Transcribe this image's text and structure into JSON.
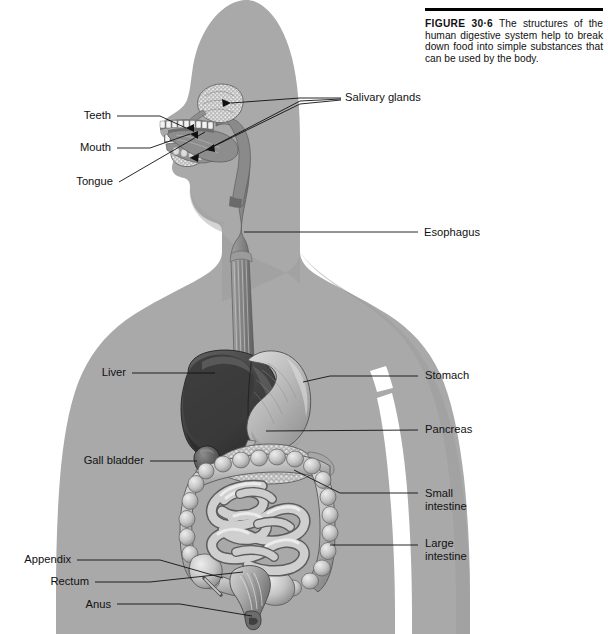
{
  "figure": {
    "number": "30·6",
    "label_word": "FIGURE",
    "caption": "The structures of the human digestive system help to break down food into simple substances that can be used by the body."
  },
  "colors": {
    "silhouette": "#a9a9a9",
    "silhouette_shadow": "#9a9a9a",
    "background": "#ffffff",
    "leader_line": "#111111",
    "text": "#111111",
    "liver": "#4a4a4a",
    "stomach": "#bdbdbd",
    "intestine": "#c9c9c9",
    "esophagus": "#8e8e8e",
    "rule": "#000000"
  },
  "labels": {
    "left": [
      {
        "id": "teeth",
        "text": "Teeth",
        "x": 80,
        "y": 109,
        "anchor_x": 115,
        "anchor_y": 116,
        "tip_x": 186,
        "tip_y": 128
      },
      {
        "id": "mouth",
        "text": "Mouth",
        "x": 78,
        "y": 141,
        "anchor_x": 115,
        "anchor_y": 148,
        "tip_x": 190,
        "tip_y": 134
      },
      {
        "id": "tongue",
        "text": "Tongue",
        "x": 75,
        "y": 175,
        "anchor_x": 117,
        "anchor_y": 182,
        "tip_x": 205,
        "tip_y": 132
      },
      {
        "id": "liver",
        "text": "Liver",
        "x": 100,
        "y": 366,
        "anchor_x": 130,
        "anchor_y": 373,
        "tip_x": 215,
        "tip_y": 373
      },
      {
        "id": "gall-bladder",
        "text": "Gall bladder",
        "x": 85,
        "y": 454,
        "anchor_x": 148,
        "anchor_y": 461,
        "tip_x": 197,
        "tip_y": 461
      },
      {
        "id": "appendix",
        "text": "Appendix",
        "x": 22,
        "y": 553,
        "anchor_x": 75,
        "anchor_y": 560,
        "tip_x": 223,
        "tip_y": 566
      },
      {
        "id": "rectum",
        "text": "Rectum",
        "x": 46,
        "y": 575,
        "anchor_x": 93,
        "anchor_y": 582,
        "tip_x": 245,
        "tip_y": 570
      },
      {
        "id": "anus",
        "text": "Anus",
        "x": 82,
        "y": 598,
        "anchor_x": 115,
        "anchor_y": 604,
        "tip_x": 253,
        "tip_y": 607
      }
    ],
    "right": [
      {
        "id": "salivary-glands",
        "text": "Salivary glands",
        "x": 345,
        "y": 91,
        "anchor_x": 340,
        "anchor_y": 98,
        "tips": [
          [
            228,
            91
          ],
          [
            213,
            146
          ],
          [
            196,
            150
          ]
        ]
      },
      {
        "id": "esophagus",
        "text": "Esophagus",
        "x": 424,
        "y": 226,
        "anchor_x": 419,
        "anchor_y": 232,
        "tip_x": 244,
        "tip_y": 232
      },
      {
        "id": "stomach",
        "text": "Stomach",
        "x": 425,
        "y": 369,
        "anchor_x": 420,
        "anchor_y": 376,
        "tip_x": 303,
        "tip_y": 381
      },
      {
        "id": "pancreas",
        "text": "Pancreas",
        "x": 425,
        "y": 423,
        "anchor_x": 420,
        "anchor_y": 430,
        "tip_x": 264,
        "tip_y": 431
      },
      {
        "id": "small-intestine",
        "text": "Small\nintestine",
        "x": 425,
        "y": 487,
        "anchor_x": 420,
        "anchor_y": 493,
        "tip_x": 294,
        "tip_y": 469
      },
      {
        "id": "large-intestine",
        "text": "Large\nintestine",
        "x": 425,
        "y": 537,
        "anchor_x": 420,
        "anchor_y": 545,
        "tip_x": 305,
        "tip_y": 545
      }
    ]
  },
  "organs": [
    {
      "id": "salivary-glands",
      "name": "Salivary glands"
    },
    {
      "id": "teeth",
      "name": "Teeth"
    },
    {
      "id": "tongue",
      "name": "Tongue"
    },
    {
      "id": "mouth",
      "name": "Mouth"
    },
    {
      "id": "esophagus",
      "name": "Esophagus"
    },
    {
      "id": "liver",
      "name": "Liver"
    },
    {
      "id": "stomach",
      "name": "Stomach"
    },
    {
      "id": "gall-bladder",
      "name": "Gall bladder"
    },
    {
      "id": "pancreas",
      "name": "Pancreas"
    },
    {
      "id": "small-intestine",
      "name": "Small intestine"
    },
    {
      "id": "large-intestine",
      "name": "Large intestine"
    },
    {
      "id": "appendix",
      "name": "Appendix"
    },
    {
      "id": "rectum",
      "name": "Rectum"
    },
    {
      "id": "anus",
      "name": "Anus"
    }
  ]
}
